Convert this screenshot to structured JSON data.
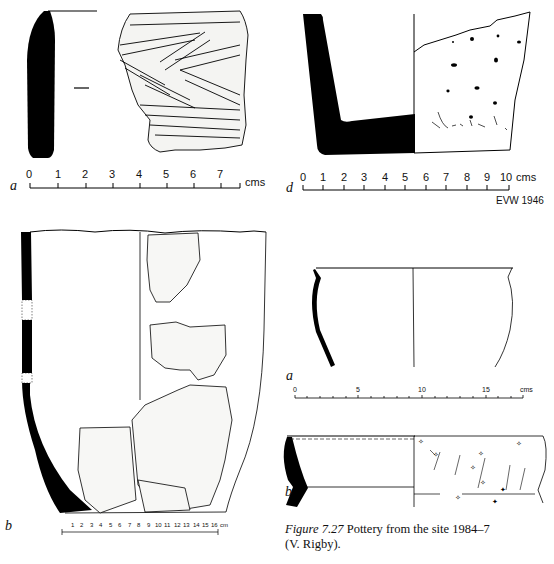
{
  "figure": {
    "caption_label": "Figure 7.27",
    "caption_text": "Pottery from the site 1984–7",
    "caption_credit": "(V. Rigby)."
  },
  "panels": {
    "top_left": {
      "letter": "a",
      "scale_ticks": [
        "0",
        "1",
        "2",
        "3",
        "4",
        "5",
        "6",
        "7"
      ],
      "scale_unit": "cms"
    },
    "top_right": {
      "letter": "d",
      "scale_ticks": [
        "0",
        "1",
        "2",
        "3",
        "4",
        "5",
        "6",
        "7",
        "8",
        "9",
        "10"
      ],
      "scale_unit": "cms",
      "credit": "EVW 1946"
    },
    "bottom_left": {
      "letter": "b",
      "scale_ticks": [
        "1",
        "2",
        "3",
        "4",
        "5",
        "6",
        "7",
        "8",
        "9",
        "10",
        "11",
        "12",
        "13",
        "14",
        "15",
        "16"
      ],
      "scale_unit": "cm"
    },
    "mid_right": {
      "letter": "a",
      "scale_ticks": [
        "0",
        "5",
        "10",
        "15"
      ],
      "scale_unit": "cms"
    },
    "bottom_right": {
      "letter": "b"
    }
  }
}
